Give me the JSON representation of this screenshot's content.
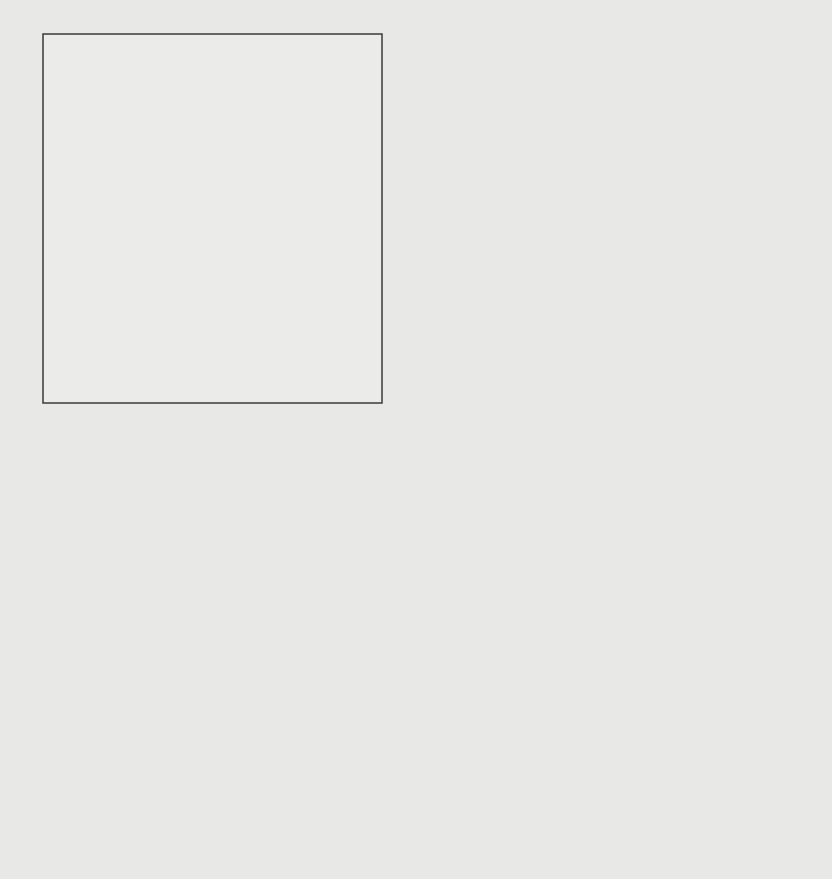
{
  "diagram": {
    "type": "flow-map",
    "center": {
      "label": "ca. 57 %",
      "value_percent": 57,
      "color": "#0a0a0a"
    },
    "flows": [
      {
        "id": "northwest",
        "direction": "north-west",
        "label": "ca. 19 %",
        "value_percent": 19,
        "arrow_text": "Wattenmeer",
        "color": "#0a0a0a"
      },
      {
        "id": "northeast",
        "direction": "north-east",
        "label": "ca. 11 %",
        "value_percent": 11,
        "arrow_text": "",
        "color": "#6e6e6e"
      },
      {
        "id": "south",
        "direction": "south-south-west",
        "label": "ca. 4 %",
        "value_percent": 4,
        "arrow_text": "",
        "color": "#7a7a7a"
      },
      {
        "id": "southeast",
        "direction": "south-east",
        "label": "ca. 9 %",
        "value_percent": 9,
        "arrow_text": "Wattenmeer",
        "color": "#0a0a0a"
      }
    ],
    "regions": [
      {
        "id": "hattstedter-marsch",
        "label_line1": "Hattstedter",
        "label_line2": "Marsch"
      },
      {
        "id": "nordstrand",
        "label": "Nordstrand"
      }
    ]
  }
}
